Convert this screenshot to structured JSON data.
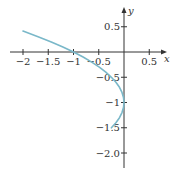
{
  "chart_data": {
    "type": "line",
    "title": "",
    "xlabel": "x",
    "ylabel": "y",
    "equation": "x = -(y+1)^2",
    "xlim": [
      -2.2,
      0.85
    ],
    "ylim": [
      -2.3,
      0.85
    ],
    "grid": false,
    "x_ticks": [
      -2,
      -1.5,
      -1,
      -0.5,
      0.5
    ],
    "x_tick_labels": [
      "−2",
      "−1.5",
      "−1",
      "−0.5",
      "0.5"
    ],
    "y_ticks": [
      0.5,
      -0.5,
      -1,
      -1.5,
      -2.0
    ],
    "y_tick_labels": [
      "0.5",
      "−0.5",
      "−1",
      "−1.5",
      "−2.0"
    ],
    "series": [
      {
        "name": "curve",
        "color": "#7ab8c9",
        "points": [
          {
            "x": -2.0,
            "y": 0.414
          },
          {
            "x": -1.69,
            "y": 0.3
          },
          {
            "x": -1.44,
            "y": 0.2
          },
          {
            "x": -1.21,
            "y": 0.1
          },
          {
            "x": -1.0,
            "y": 0.0
          },
          {
            "x": -0.81,
            "y": -0.1
          },
          {
            "x": -0.64,
            "y": -0.2
          },
          {
            "x": -0.49,
            "y": -0.3
          },
          {
            "x": -0.36,
            "y": -0.4
          },
          {
            "x": -0.25,
            "y": -0.5
          },
          {
            "x": -0.16,
            "y": -0.6
          },
          {
            "x": -0.09,
            "y": -0.7
          },
          {
            "x": -0.04,
            "y": -0.8
          },
          {
            "x": -0.01,
            "y": -0.9
          },
          {
            "x": 0.0,
            "y": -1.0
          },
          {
            "x": -0.01,
            "y": -1.1
          },
          {
            "x": -0.04,
            "y": -1.2
          },
          {
            "x": -0.09,
            "y": -1.3
          },
          {
            "x": -0.16,
            "y": -1.4
          },
          {
            "x": -0.25,
            "y": -1.5
          }
        ]
      }
    ]
  },
  "colors": {
    "axis": "#333333",
    "curve": "#7ab8c9"
  }
}
